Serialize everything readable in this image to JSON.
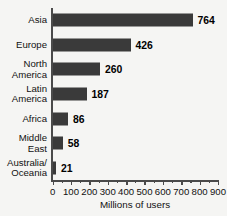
{
  "chart_data": {
    "type": "bar",
    "orientation": "horizontal",
    "title": "",
    "xlabel": "Millions of users",
    "ylabel": "",
    "categories": [
      "Asia",
      "Europe",
      "North\nAmerica",
      "Latin\nAmerica",
      "Africa",
      "Middle\nEast",
      "Australia/\nOceania"
    ],
    "values": [
      764,
      426,
      260,
      187,
      86,
      58,
      21
    ],
    "value_labels": [
      "764",
      "426",
      "260",
      "187",
      "86",
      "58",
      "21"
    ],
    "xlim": [
      0,
      900
    ],
    "xticks": [
      0,
      100,
      200,
      300,
      400,
      500,
      600,
      700,
      800,
      900
    ],
    "xtick_labels": [
      "0",
      "100",
      "200",
      "300",
      "400",
      "500",
      "600",
      "700",
      "800",
      "900"
    ],
    "minor_tick_step": 50,
    "grid": false,
    "legend": false,
    "bar_color": "#3a3a3a",
    "background_color": "#f5f5f3",
    "axis_color": "#4a4a4a",
    "label_color": "#111111"
  },
  "axis": {
    "x_title": "Millions of users"
  }
}
